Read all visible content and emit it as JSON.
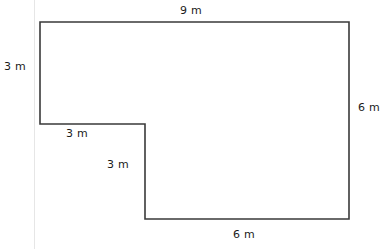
{
  "figure": {
    "type": "geometry-diagram",
    "shape_name": "l-shaped-polygon",
    "stroke_color": "#3a3a3a",
    "fill_color": "#ffffff",
    "background_color": "#ffffff",
    "margin_rule_color": "#e6e6e6",
    "unit": "m",
    "vertices": [
      {
        "name": "top-left",
        "x": 40,
        "y": 22
      },
      {
        "name": "top-right",
        "x": 349,
        "y": 22
      },
      {
        "name": "bottom-right",
        "x": 349,
        "y": 219
      },
      {
        "name": "bottom-left",
        "x": 145,
        "y": 219
      },
      {
        "name": "inner-corner",
        "x": 145,
        "y": 124
      },
      {
        "name": "left-lower",
        "x": 40,
        "y": 124
      }
    ],
    "path": "M 40 22 L 349 22 L 349 219 L 145 219 L 145 124 L 40 124 Z"
  },
  "labels": {
    "top": "9 m",
    "left": "3 m",
    "right": "6 m",
    "notch_top": "3 m",
    "notch_left": "3 m",
    "bottom": "6 m"
  },
  "chart_data": {
    "type": "table",
    "title": "",
    "categories": [
      "top",
      "left",
      "notch_top",
      "notch_left",
      "bottom",
      "right"
    ],
    "values": [
      9,
      3,
      3,
      3,
      6,
      6
    ],
    "xlabel": "side",
    "ylabel": "length (m)"
  }
}
